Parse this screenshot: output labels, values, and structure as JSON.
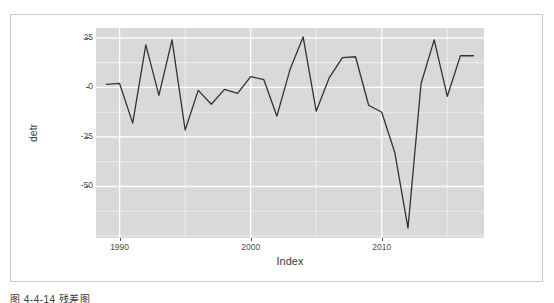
{
  "figure": {
    "caption": "图 4-4-14  残差图"
  },
  "chart_data": {
    "type": "line",
    "title": "",
    "subtitle": "",
    "xlabel": "Index",
    "ylabel": "detr",
    "x_tick_labels": [
      "1990",
      "2000",
      "2010"
    ],
    "x_ticks": [
      1990,
      2000,
      2010
    ],
    "y_tick_labels": [
      "25",
      "0",
      "-25",
      "-50"
    ],
    "y_ticks": [
      25,
      0,
      -25,
      -50
    ],
    "xlim": [
      1988.2,
      2017.8
    ],
    "ylim": [
      -76,
      30
    ],
    "grid": true,
    "grid_major_color": "#ffffff",
    "grid_minor_color": "#ebebeb",
    "panel_background": "#d9d9d9",
    "legend": "none",
    "line_color": "#333333",
    "line_width": 1.3,
    "x": [
      1989,
      1990,
      1991,
      1992,
      1993,
      1994,
      1995,
      1996,
      1997,
      1998,
      1999,
      2000,
      2001,
      2002,
      2003,
      2004,
      2005,
      2006,
      2007,
      2008,
      2009,
      2010,
      2011,
      2012,
      2013,
      2014,
      2015,
      2016,
      2017
    ],
    "values": [
      1.5,
      2.0,
      -18.0,
      21.5,
      -4.0,
      24.0,
      -21.5,
      -1.5,
      -8.5,
      -1.0,
      -3.0,
      5.5,
      4.0,
      -14.5,
      9.0,
      25.5,
      -12.0,
      5.0,
      15.0,
      15.5,
      -9.0,
      -12.5,
      -33.0,
      -71.0,
      2.0,
      24.0,
      -4.5,
      16.0,
      16.0
    ],
    "series": [
      {
        "name": "detr",
        "values": [
          1.5,
          2.0,
          -18.0,
          21.5,
          -4.0,
          24.0,
          -21.5,
          -1.5,
          -8.5,
          -1.0,
          -3.0,
          5.5,
          4.0,
          -14.5,
          9.0,
          25.5,
          -12.0,
          5.0,
          15.0,
          15.5,
          -9.0,
          -12.5,
          -33.0,
          -71.0,
          2.0,
          24.0,
          -4.5,
          16.0,
          16.0
        ]
      }
    ]
  }
}
